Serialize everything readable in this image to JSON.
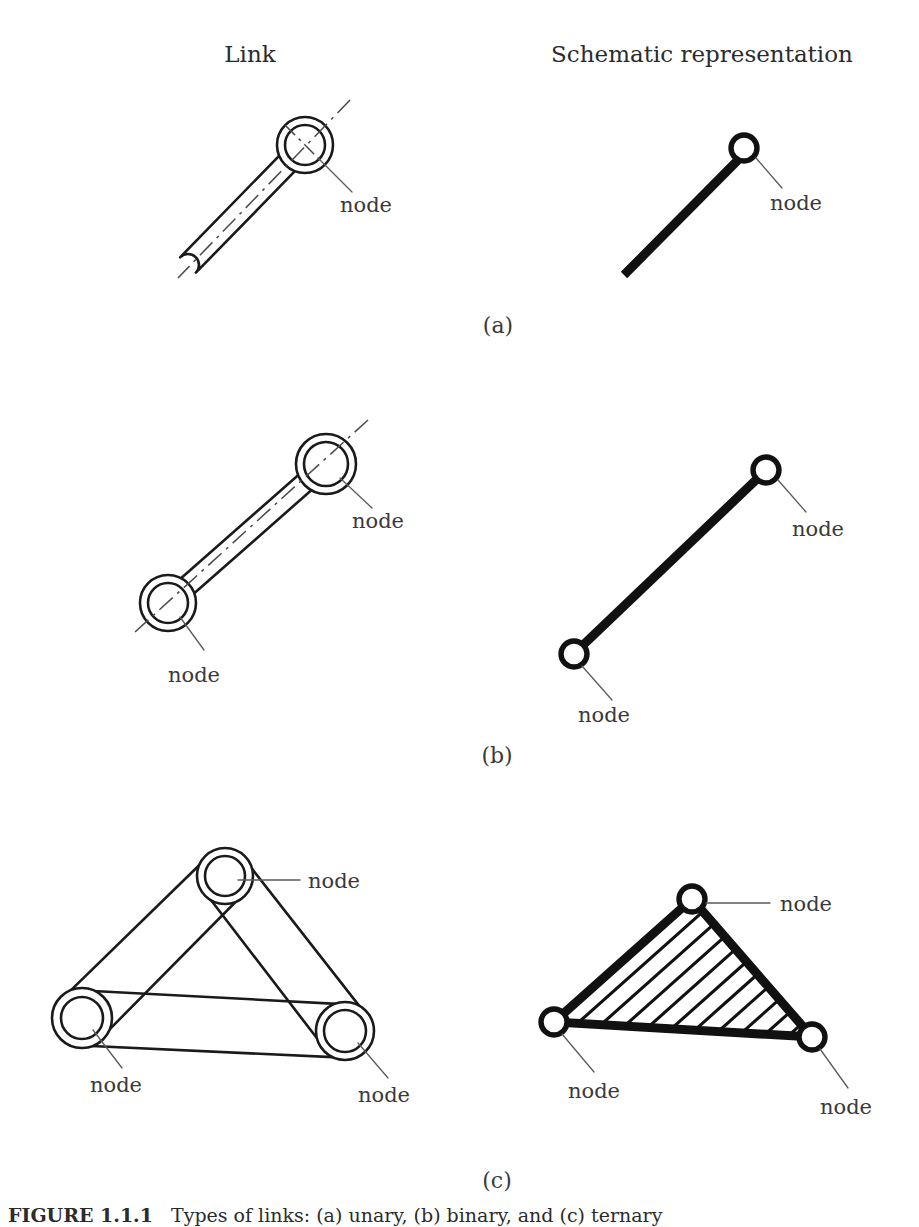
{
  "figure": {
    "background_color": "#ffffff",
    "ink_color": "#1a1a1a",
    "width": 919,
    "height": 1227,
    "columns": {
      "left_header": "Link",
      "right_header": "Schematic representation"
    },
    "panel_labels": {
      "a": "(a)",
      "b": "(b)",
      "c": "(c)"
    },
    "node_label": "node",
    "caption": {
      "number": "FIGURE 1.1.1",
      "text": "Types of links: (a) unary, (b) binary, and (c) ternary"
    }
  },
  "panels": [
    {
      "id": "a",
      "label": "(a)",
      "kind": "unary",
      "node_count": 1,
      "link_drawing": {
        "bosses": [
          {
            "cx": 305,
            "cy": 145,
            "r_outer": 28,
            "r_inner": 20
          }
        ],
        "bar_far_end": {
          "x": 188,
          "y": 265
        },
        "bar_half_width": 11,
        "centerline": {
          "x1": 350,
          "y1": 100,
          "x2": 178,
          "y2": 278
        },
        "leaders": [
          {
            "x1": 318,
            "y1": 158,
            "x2": 352,
            "y2": 192,
            "label_x": 340,
            "label_y": 212
          }
        ]
      },
      "schematic": {
        "bar": {
          "x1": 624,
          "y1": 275,
          "x2": 738,
          "y2": 160
        },
        "circles": [
          {
            "cx": 744,
            "cy": 148,
            "r": 13
          }
        ],
        "leaders": [
          {
            "x1": 756,
            "y1": 158,
            "x2": 782,
            "y2": 188,
            "label_x": 770,
            "label_y": 210
          }
        ]
      }
    },
    {
      "id": "b",
      "label": "(b)",
      "kind": "binary",
      "node_count": 2,
      "link_drawing": {
        "bosses": [
          {
            "cx": 326,
            "cy": 464,
            "r_outer": 30,
            "r_inner": 22
          },
          {
            "cx": 168,
            "cy": 603,
            "r_outer": 28,
            "r_inner": 20
          }
        ],
        "bar_half_width": 10,
        "centerline": {
          "x1": 368,
          "y1": 420,
          "x2": 135,
          "y2": 632
        },
        "leaders": [
          {
            "x1": 340,
            "y1": 478,
            "x2": 372,
            "y2": 508,
            "label_x": 352,
            "label_y": 528
          },
          {
            "x1": 180,
            "y1": 617,
            "x2": 204,
            "y2": 650,
            "label_x": 168,
            "label_y": 682
          }
        ]
      },
      "schematic": {
        "bar": {
          "x1": 580,
          "y1": 648,
          "x2": 758,
          "y2": 478
        },
        "circles": [
          {
            "cx": 766,
            "cy": 470,
            "r": 13
          },
          {
            "cx": 574,
            "cy": 654,
            "r": 13
          }
        ],
        "leaders": [
          {
            "x1": 778,
            "y1": 480,
            "x2": 806,
            "y2": 512,
            "label_x": 792,
            "label_y": 536
          },
          {
            "x1": 582,
            "y1": 666,
            "x2": 612,
            "y2": 700,
            "label_x": 578,
            "label_y": 722
          }
        ]
      }
    },
    {
      "id": "c",
      "label": "(c)",
      "kind": "ternary",
      "node_count": 3,
      "link_drawing": {
        "bosses": [
          {
            "cx": 225,
            "cy": 876,
            "r_outer": 28,
            "r_inner": 20
          },
          {
            "cx": 82,
            "cy": 1018,
            "r_outer": 30,
            "r_inner": 21
          },
          {
            "cx": 345,
            "cy": 1031,
            "r_outer": 29,
            "r_inner": 21
          }
        ],
        "leaders": [
          {
            "x1": 238,
            "y1": 880,
            "x2": 300,
            "y2": 880,
            "label_x": 308,
            "label_y": 888
          },
          {
            "x1": 93,
            "y1": 1030,
            "x2": 122,
            "y2": 1068,
            "label_x": 90,
            "label_y": 1092
          },
          {
            "x1": 358,
            "y1": 1043,
            "x2": 388,
            "y2": 1078,
            "label_x": 358,
            "label_y": 1102
          }
        ]
      },
      "schematic": {
        "triangle": [
          {
            "x": 692,
            "y": 899
          },
          {
            "x": 554,
            "y": 1022
          },
          {
            "x": 812,
            "y": 1037
          }
        ],
        "circles": [
          {
            "cx": 692,
            "cy": 899,
            "r": 13
          },
          {
            "cx": 554,
            "cy": 1022,
            "r": 13
          },
          {
            "cx": 812,
            "cy": 1037,
            "r": 13
          }
        ],
        "hatch_count": 10,
        "leaders": [
          {
            "x1": 706,
            "y1": 903,
            "x2": 770,
            "y2": 903,
            "label_x": 780,
            "label_y": 911
          },
          {
            "x1": 562,
            "y1": 1034,
            "x2": 594,
            "y2": 1072,
            "label_x": 568,
            "label_y": 1098
          },
          {
            "x1": 820,
            "y1": 1049,
            "x2": 848,
            "y2": 1088,
            "label_x": 820,
            "label_y": 1114
          }
        ]
      }
    }
  ],
  "layout": {
    "header_y": 62,
    "left_header_x": 250,
    "right_header_x": 702,
    "label_a": {
      "x": 498,
      "y": 333
    },
    "label_b": {
      "x": 497,
      "y": 763
    },
    "label_c": {
      "x": 497,
      "y": 1188
    },
    "caption_x": 8,
    "caption_y": 1222
  }
}
